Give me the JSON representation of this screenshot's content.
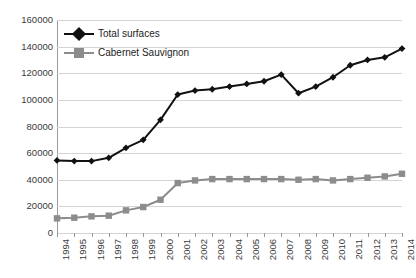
{
  "chart_data": {
    "type": "line",
    "title": "",
    "subtitle": "",
    "xlabel": "",
    "ylabel": "",
    "grid": true,
    "legend_position": "top-left",
    "ylim": [
      0,
      160000
    ],
    "ytick_interval": 20000,
    "ytick_labels": [
      "160000",
      "140000",
      "120000",
      "100000",
      "80000",
      "60000",
      "40000",
      "20000",
      "0"
    ],
    "ytick_values": [
      160000,
      140000,
      120000,
      100000,
      80000,
      60000,
      40000,
      20000,
      0
    ],
    "categories": [
      "1994",
      "1995",
      "1996",
      "1997",
      "1998",
      "1999",
      "2000",
      "2001",
      "2002",
      "2003",
      "2004",
      "2005",
      "2006",
      "2007",
      "2008",
      "2009",
      "2010",
      "2011",
      "2012",
      "2013",
      "2014"
    ],
    "series": [
      {
        "name": "Total surfaces",
        "color": "#111111",
        "marker": "diamond",
        "values": [
          54500,
          54000,
          54000,
          56500,
          64000,
          70000,
          85000,
          104000,
          107000,
          108000,
          110000,
          112000,
          114000,
          119000,
          105000,
          110000,
          117000,
          126000,
          130000,
          132000,
          138500
        ]
      },
      {
        "name": "Cabernet Sauvignon",
        "color": "#8c8c8c",
        "marker": "square",
        "values": [
          11000,
          11500,
          12500,
          13000,
          17000,
          19500,
          25000,
          37500,
          39500,
          40500,
          40500,
          40500,
          40500,
          40500,
          40000,
          40500,
          39500,
          40500,
          41500,
          42500,
          44500
        ]
      }
    ]
  },
  "legend": {
    "items": [
      {
        "label": "Total surfaces",
        "color": "#111111",
        "marker": "diamond"
      },
      {
        "label": "Cabernet Sauvignon",
        "color": "#8c8c8c",
        "marker": "square"
      }
    ]
  },
  "colors": {
    "total_surfaces": "#111111",
    "cabernet_sauvignon": "#8c8c8c",
    "gridline": "#d4d4d4",
    "axis": "#9a9a9a",
    "tick_text": "#3a3a3a",
    "background": "#ffffff"
  }
}
